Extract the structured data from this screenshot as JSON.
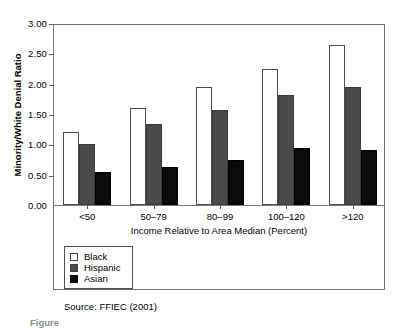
{
  "chart_data": {
    "type": "bar",
    "title": "",
    "xlabel": "Income Relative to Area Median (Percent)",
    "ylabel": "Minority/White Denial Ratio",
    "categories": [
      "<50",
      "50–79",
      "80–99",
      "100–120",
      ">120"
    ],
    "series": [
      {
        "name": "Black",
        "values": [
          1.21,
          1.6,
          1.94,
          2.25,
          2.63
        ],
        "color": "#ffffff"
      },
      {
        "name": "Hispanic",
        "values": [
          1.01,
          1.33,
          1.57,
          1.82,
          1.94
        ],
        "color": "#4a4a4a"
      },
      {
        "name": "Asian",
        "values": [
          0.54,
          0.62,
          0.74,
          0.94,
          0.91
        ],
        "color": "#0a0a0a"
      }
    ],
    "ylim": [
      0.0,
      3.0
    ],
    "ytick_step": 0.5,
    "ytick_labels": [
      "0.00",
      "0.50",
      "1.00",
      "1.50",
      "2.00",
      "2.50",
      "3.00"
    ],
    "grid": false,
    "legend_position": "below-left",
    "annotations": [
      "Source: FFIEC (2001)"
    ]
  },
  "legend": {
    "items": [
      {
        "label": "Black",
        "swatch": "series-black"
      },
      {
        "label": "Hispanic",
        "swatch": "series-hispanic"
      },
      {
        "label": "Asian",
        "swatch": "series-asian"
      }
    ]
  },
  "source": {
    "text": "Source: FFIEC (2001)"
  },
  "caption": {
    "stub": "Figure"
  }
}
